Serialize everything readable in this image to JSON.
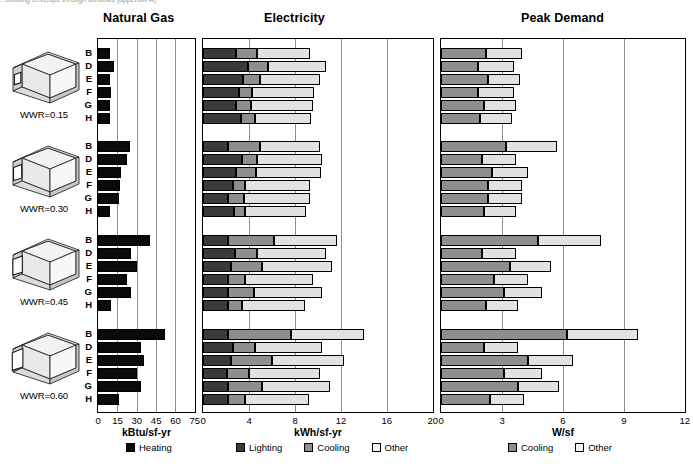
{
  "figure": {
    "clipped_caption": "...building envelope through windows (appendix A)",
    "row_labels": [
      "B",
      "D",
      "E",
      "F",
      "G",
      "H"
    ],
    "groups": [
      {
        "label": "WWR=0.15",
        "wwr": 0.15
      },
      {
        "label": "WWR=0.30",
        "wwr": 0.3
      },
      {
        "label": "WWR=0.45",
        "wwr": 0.45
      },
      {
        "label": "WWR=0.60",
        "wwr": 0.6
      }
    ],
    "icon_name": "isometric-building-box-icon"
  },
  "chart_data": [
    {
      "type": "bar",
      "orientation": "horizontal",
      "stacked": true,
      "title": "Natural Gas",
      "xlabel": "kBtu/sf-yr",
      "ylabel": "",
      "xlim": [
        0,
        75
      ],
      "xticks": [
        0,
        15,
        30,
        45,
        60,
        75
      ],
      "grid": true,
      "legend_position": "below",
      "legend": [
        "Heating"
      ],
      "group_labels": [
        "WWR=0.15",
        "WWR=0.30",
        "WWR=0.45",
        "WWR=0.60"
      ],
      "categories": [
        "B",
        "D",
        "E",
        "F",
        "G",
        "H"
      ],
      "series": [
        {
          "name": "Heating",
          "color": "#0a0a0a",
          "values_by_group": [
            [
              9.5,
              12.5,
              9.0,
              10.0,
              9.5,
              9.0
            ],
            [
              25.0,
              22.5,
              18.0,
              17.0,
              16.0,
              9.0
            ],
            [
              40.0,
              26.0,
              30.0,
              22.5,
              25.5,
              10.0
            ],
            [
              52.0,
              33.0,
              36.0,
              30.0,
              33.5,
              16.0
            ]
          ]
        }
      ]
    },
    {
      "type": "bar",
      "orientation": "horizontal",
      "stacked": true,
      "title": "Electricity",
      "xlabel": "kWh/sf-yr",
      "ylabel": "",
      "xlim": [
        0,
        20
      ],
      "xticks": [
        0,
        4,
        8,
        12,
        16,
        20
      ],
      "grid": true,
      "legend_position": "below",
      "legend": [
        "Lighting",
        "Cooling",
        "Other"
      ],
      "group_labels": [
        "WWR=0.15",
        "WWR=0.30",
        "WWR=0.45",
        "WWR=0.60"
      ],
      "categories": [
        "B",
        "D",
        "E",
        "F",
        "G",
        "H"
      ],
      "series": [
        {
          "name": "Lighting",
          "color": "#3a3a3a",
          "values_by_group": [
            [
              2.9,
              3.9,
              3.5,
              3.1,
              2.9,
              3.3
            ],
            [
              2.2,
              3.4,
              2.9,
              2.6,
              2.2,
              2.7
            ],
            [
              2.2,
              2.8,
              2.4,
              2.2,
              2.2,
              2.2
            ],
            [
              2.2,
              2.6,
              2.4,
              2.1,
              2.2,
              2.2
            ]
          ]
        },
        {
          "name": "Cooling",
          "color": "#8e8e8e",
          "values_by_group": [
            [
              1.8,
              1.8,
              1.5,
              1.2,
              1.3,
              1.2
            ],
            [
              2.8,
              1.3,
              1.7,
              1.1,
              1.4,
              1.0
            ],
            [
              4.0,
              1.9,
              2.7,
              1.5,
              2.2,
              1.2
            ],
            [
              5.5,
              1.9,
              3.6,
              1.9,
              2.9,
              1.5
            ]
          ]
        },
        {
          "name": "Other",
          "color": "#e2e2e2",
          "values_by_group": [
            [
              4.6,
              5.0,
              5.2,
              5.4,
              5.4,
              4.9
            ],
            [
              5.2,
              5.7,
              5.7,
              5.6,
              5.7,
              5.3
            ],
            [
              5.5,
              6.0,
              6.1,
              5.9,
              6.0,
              5.5
            ],
            [
              6.3,
              5.9,
              6.3,
              6.2,
              6.0,
              5.5
            ]
          ]
        }
      ]
    },
    {
      "type": "bar",
      "orientation": "horizontal",
      "stacked": true,
      "title": "Peak Demand",
      "xlabel": "W/sf",
      "ylabel": "",
      "xlim": [
        0,
        12
      ],
      "xticks": [
        0,
        3,
        6,
        9,
        12
      ],
      "grid": true,
      "legend_position": "below",
      "legend": [
        "Cooling",
        "Other"
      ],
      "group_labels": [
        "WWR=0.15",
        "WWR=0.30",
        "WWR=0.45",
        "WWR=0.60"
      ],
      "categories": [
        "B",
        "D",
        "E",
        "F",
        "G",
        "H"
      ],
      "series": [
        {
          "name": "Cooling",
          "color": "#8e8e8e",
          "values_by_group": [
            [
              2.2,
              1.8,
              2.3,
              1.8,
              2.1,
              1.9
            ],
            [
              3.2,
              2.0,
              2.5,
              2.3,
              2.3,
              2.1
            ],
            [
              4.8,
              2.0,
              3.4,
              2.6,
              3.1,
              2.2
            ],
            [
              6.2,
              2.1,
              4.3,
              3.1,
              3.8,
              2.4
            ]
          ]
        },
        {
          "name": "Other",
          "color": "#e2e2e2",
          "values_by_group": [
            [
              1.8,
              1.8,
              1.6,
              1.8,
              1.6,
              1.6
            ],
            [
              2.5,
              1.7,
              1.8,
              1.7,
              1.7,
              1.6
            ],
            [
              3.1,
              1.7,
              2.0,
              1.7,
              1.9,
              1.6
            ],
            [
              3.5,
              1.7,
              2.2,
              1.9,
              2.0,
              1.7
            ]
          ]
        }
      ]
    }
  ]
}
